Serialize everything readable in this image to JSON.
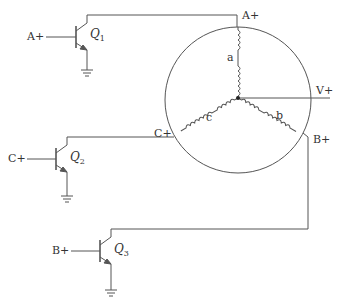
{
  "diagram": {
    "colors": {
      "line": "#555555",
      "text": "#333333",
      "background": "#ffffff"
    },
    "transistors": [
      {
        "id": "Q1",
        "label": "Q",
        "subscript": "1",
        "input_label": "A+"
      },
      {
        "id": "Q2",
        "label": "Q",
        "subscript": "2",
        "input_label": "C+"
      },
      {
        "id": "Q3",
        "label": "Q",
        "subscript": "3",
        "input_label": "B+"
      }
    ],
    "motor": {
      "terminals": {
        "a": "A+",
        "b": "B+",
        "c": "C+",
        "neutral": "V+"
      },
      "windings": [
        "a",
        "b",
        "c"
      ]
    }
  }
}
